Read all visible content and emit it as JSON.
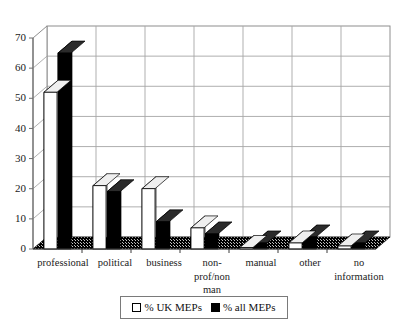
{
  "chart_data": {
    "type": "bar",
    "title": "",
    "subtitle": "",
    "xlabel": "",
    "ylabel": "",
    "ylim": [
      0,
      70
    ],
    "ytick_step": 10,
    "yticks": [
      "0",
      "10",
      "20",
      "30",
      "40",
      "50",
      "60",
      "70"
    ],
    "grid": true,
    "style": "3d-clustered-bar",
    "legend_position": "bottom-center",
    "categories": [
      "professional",
      "political",
      "business",
      "non-\nprof/non\nman",
      "manual",
      "other",
      "no\ninformation"
    ],
    "series": [
      {
        "name": "% UK MEPs",
        "color": "#ffffff",
        "values": [
          52,
          21,
          20,
          7,
          0.5,
          2,
          1
        ]
      },
      {
        "name": "% all MEPs",
        "color": "#000000",
        "values": [
          65,
          19,
          9,
          5,
          2,
          4,
          2
        ]
      }
    ]
  },
  "legend": {
    "entries": [
      {
        "label": "% UK MEPs",
        "swatch": "light-square-icon"
      },
      {
        "label": "% all MEPs",
        "swatch": "dark-square-icon"
      }
    ]
  },
  "colors": {
    "bar_light": "#ffffff",
    "bar_dark": "#000000",
    "grid": "#9a9a9a",
    "axis": "#6f6f6f",
    "floor": "#1a1a1a",
    "text": "#111111",
    "background": "#ffffff"
  }
}
